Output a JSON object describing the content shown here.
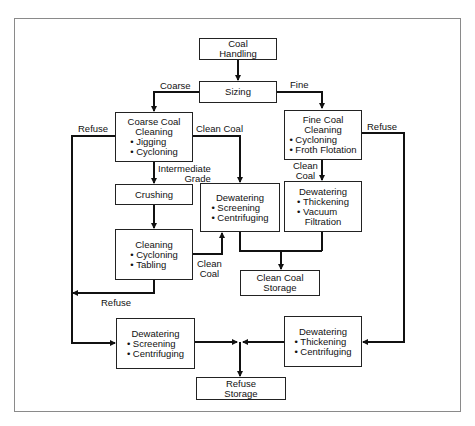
{
  "diagram": {
    "nodes": {
      "coal_handling": {
        "title": "Coal",
        "title2": "Handling"
      },
      "sizing": {
        "title": "Sizing"
      },
      "coarse_cleaning": {
        "title": "Coarse Coal",
        "title2": "Cleaning",
        "items": [
          "Jigging",
          "Cycloning"
        ]
      },
      "fine_cleaning": {
        "title": "Fine Coal",
        "title2": "Cleaning",
        "items": [
          "Cycloning",
          "Froth Flotation"
        ]
      },
      "crushing": {
        "title": "Crushing"
      },
      "dewatering_mid": {
        "title": "Dewatering",
        "items": [
          "Screening",
          "Centrifuging"
        ]
      },
      "dewatering_fine": {
        "title": "Dewatering",
        "items": [
          "Thickening",
          "Vacuum"
        ],
        "item_cont": "Filtration"
      },
      "cleaning": {
        "title": "Cleaning",
        "items": [
          "Cycloning",
          "Tabling"
        ]
      },
      "clean_coal_storage": {
        "title": "Clean Coal",
        "title2": "Storage"
      },
      "dewatering_refuse_left": {
        "title": "Dewatering",
        "items": [
          "Screening",
          "Centrifuging"
        ]
      },
      "dewatering_refuse_right": {
        "title": "Dewatering",
        "items": [
          "Thickening",
          "Centrifuging"
        ]
      },
      "refuse_storage": {
        "title": "Refuse",
        "title2": "Storage"
      }
    },
    "edge_labels": {
      "coarse": "Coarse",
      "fine": "Fine",
      "refuse_left": "Refuse",
      "clean_coal_coarse": "Clean Coal",
      "intermediate_1": "Intermediate",
      "intermediate_2": "Grade",
      "refuse_right": "Refuse",
      "clean_fine_1": "Clean",
      "clean_fine_2": "Coal",
      "clean_cleaning_1": "Clean",
      "clean_cleaning_2": "Coal",
      "refuse_bottom": "Refuse"
    }
  }
}
